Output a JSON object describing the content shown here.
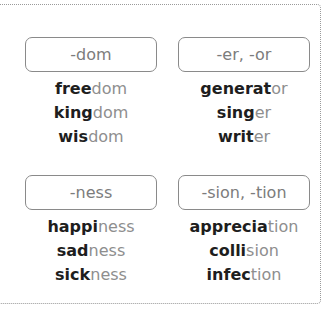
{
  "groups": [
    {
      "suffix": "-dom",
      "words": [
        {
          "stem": "free",
          "ending": "dom"
        },
        {
          "stem": "king",
          "ending": "dom"
        },
        {
          "stem": "wis",
          "ending": "dom"
        }
      ]
    },
    {
      "suffix": "-er, -or",
      "words": [
        {
          "stem": "generat",
          "ending": "or"
        },
        {
          "stem": "sing",
          "ending": "er"
        },
        {
          "stem": "writ",
          "ending": "er"
        }
      ]
    },
    {
      "suffix": "-ness",
      "words": [
        {
          "stem": "happi",
          "ending": "ness"
        },
        {
          "stem": "sad",
          "ending": "ness"
        },
        {
          "stem": "sick",
          "ending": "ness"
        }
      ]
    },
    {
      "suffix": "-sion, -tion",
      "words": [
        {
          "stem": "apprecia",
          "ending": "tion"
        },
        {
          "stem": "colli",
          "ending": "sion"
        },
        {
          "stem": "infec",
          "ending": "tion"
        }
      ]
    }
  ],
  "colors": {
    "stem": "#1e1e1e",
    "ending": "#8e8e8e",
    "suffix_label": "#7c7c7c",
    "border": "#8a8a8a"
  }
}
